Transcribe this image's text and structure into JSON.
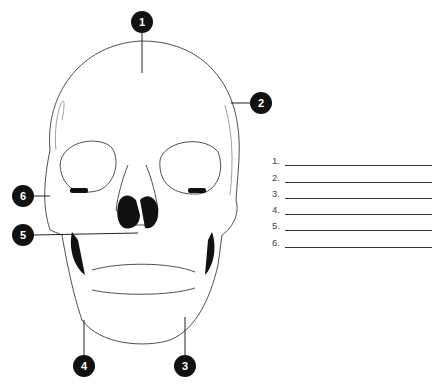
{
  "diagram": {
    "markers": [
      {
        "id": "1",
        "x": 142,
        "y": 22
      },
      {
        "id": "2",
        "x": 261,
        "y": 103
      },
      {
        "id": "3",
        "x": 185,
        "y": 366
      },
      {
        "id": "4",
        "x": 84,
        "y": 366
      },
      {
        "id": "5",
        "x": 23,
        "y": 235
      },
      {
        "id": "6",
        "x": 23,
        "y": 196
      }
    ]
  },
  "answers": {
    "rows": [
      {
        "label": "1.",
        "value": ""
      },
      {
        "label": "2.",
        "value": ""
      },
      {
        "label": "3.",
        "value": ""
      },
      {
        "label": "4.",
        "value": ""
      },
      {
        "label": "5.",
        "value": ""
      },
      {
        "label": "6.",
        "value": ""
      }
    ]
  }
}
